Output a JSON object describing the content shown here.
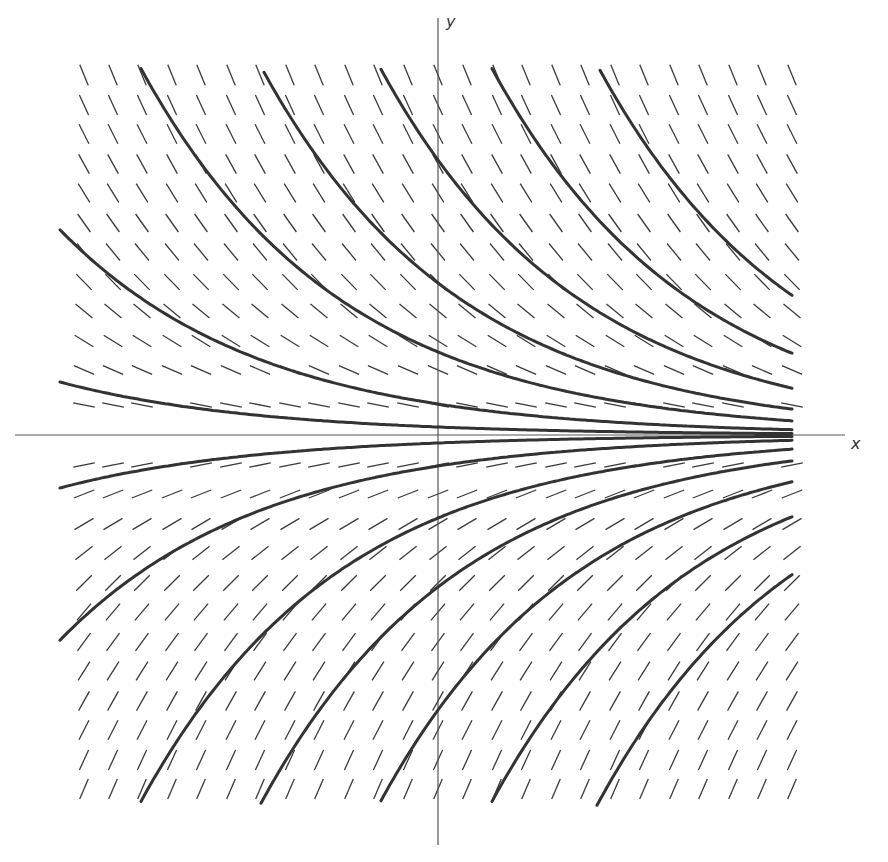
{
  "chart_data": {
    "type": "direction-field",
    "title": "",
    "equation": "dy/dx = -y",
    "xlabel": "x",
    "ylabel": "y",
    "grid": false,
    "legend": null,
    "axes": {
      "origin_px": [
        438,
        435
      ],
      "x_axis_span_px": [
        15,
        845
      ],
      "y_axis_span_px": [
        18,
        845
      ]
    },
    "slope_field": {
      "columns_px": [
        84,
        113,
        142,
        172,
        201,
        231,
        260,
        290,
        319,
        349,
        378,
        408,
        438,
        467,
        497,
        526,
        556,
        585,
        615,
        644,
        674,
        703,
        733,
        762,
        792
      ],
      "rows_px": [
        75,
        105,
        134,
        164,
        193,
        223,
        252,
        282,
        311,
        341,
        370,
        405,
        465,
        494,
        524,
        553,
        583,
        612,
        642,
        671,
        701,
        730,
        760,
        789
      ],
      "segment_length_px": 22,
      "slope_scale_px": 150
    },
    "solution_curves": {
      "family": "y = C e^(-x)",
      "decay_scale_px": 200,
      "x_end_px": 793,
      "upper_offsets_at_y_axis_px": [
        8,
        31,
        83,
        152,
        275,
        480,
        820
      ],
      "lower_offsets_at_y_axis_px": [
        8,
        31,
        83,
        152,
        275,
        480,
        820
      ],
      "clip_top_px": 68,
      "clip_bottom_px": 806
    },
    "colors": {
      "curve": "#333333",
      "field": "#3a3a3a",
      "axis": "#555555",
      "background": "#ffffff"
    }
  },
  "labels": {
    "x_axis": "x",
    "y_axis": "y"
  }
}
